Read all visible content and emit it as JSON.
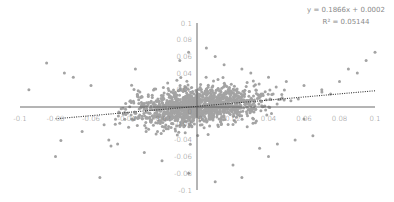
{
  "chart_data": {
    "type": "scatter",
    "title": "",
    "xlabel": "",
    "ylabel": "",
    "xlim": [
      -0.1,
      0.1
    ],
    "ylim": [
      -0.1,
      0.1
    ],
    "grid": false,
    "legend": null,
    "x_ticks": [
      "-0.1",
      "-0.08",
      "-0.06",
      "-0.04",
      "-0.02",
      "0",
      "0.02",
      "0.04",
      "0.06",
      "0.08",
      "0.1"
    ],
    "y_ticks": [
      "0.1",
      "0.08",
      "0.06",
      "0.04",
      "0.02",
      "0",
      "-0.02",
      "-0.04",
      "-0.06",
      "-0.08",
      "-0.1"
    ],
    "trendline": {
      "type": "linear",
      "slope": 0.1866,
      "intercept": 0.0002,
      "r_squared": 0.05144,
      "style": "dotted",
      "x_range": [
        -0.08,
        0.1
      ]
    },
    "annotations": {
      "equation": "y = 0.1866x + 0.0002",
      "r_squared": "R² = 0.05144"
    },
    "series": [
      {
        "name": "returns",
        "color": "#a3a3a3",
        "cloud": {
          "n": 1400,
          "x_sd": 0.018,
          "y_sd": 0.011,
          "seed": 7
        },
        "outliers": [
          [
            -0.075,
            0.04
          ],
          [
            -0.085,
            0.052
          ],
          [
            -0.07,
            0.035
          ],
          [
            -0.095,
            0.02
          ],
          [
            -0.06,
            0.025
          ],
          [
            -0.065,
            -0.03
          ],
          [
            -0.08,
            -0.06
          ],
          [
            -0.055,
            -0.085
          ],
          [
            -0.045,
            -0.045
          ],
          [
            -0.05,
            -0.04
          ],
          [
            -0.035,
            0.045
          ],
          [
            -0.03,
            -0.055
          ],
          [
            -0.02,
            -0.065
          ],
          [
            -0.01,
            0.055
          ],
          [
            -0.005,
            0.065
          ],
          [
            0.005,
            0.07
          ],
          [
            0.01,
            0.06
          ],
          [
            0.015,
            0.05
          ],
          [
            0.02,
            -0.07
          ],
          [
            0.025,
            0.045
          ],
          [
            0.03,
            0.04
          ],
          [
            0.035,
            -0.05
          ],
          [
            0.04,
            0.035
          ],
          [
            0.045,
            -0.045
          ],
          [
            0.05,
            0.03
          ],
          [
            0.055,
            -0.04
          ],
          [
            0.06,
            0.025
          ],
          [
            0.065,
            -0.035
          ],
          [
            0.07,
            0.02
          ],
          [
            0.075,
            0.015
          ],
          [
            0.08,
            0.03
          ],
          [
            0.085,
            0.045
          ],
          [
            0.09,
            0.04
          ],
          [
            0.095,
            0.055
          ],
          [
            0.1,
            0.065
          ],
          [
            0.01,
            -0.09
          ],
          [
            0.025,
            -0.085
          ],
          [
            -0.005,
            -0.08
          ],
          [
            0.04,
            -0.06
          ],
          [
            0.06,
            -0.015
          ]
        ]
      }
    ]
  }
}
